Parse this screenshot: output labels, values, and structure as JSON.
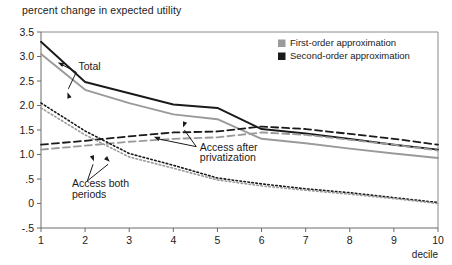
{
  "chart_data": {
    "type": "line",
    "title": "percent change in expected utility",
    "xlabel": "decile",
    "ylabel": "",
    "x": [
      1,
      2,
      3,
      4,
      5,
      6,
      7,
      8,
      9,
      10
    ],
    "xlim": [
      1,
      10
    ],
    "ylim": [
      -0.5,
      3.5
    ],
    "yticks": [
      "3.5",
      "3.0",
      "2.5",
      "2.0",
      "1.5",
      "1.0",
      ".5",
      "0",
      "-.5"
    ],
    "ytick_values": [
      3.5,
      3.0,
      2.5,
      2.0,
      1.5,
      1.0,
      0.5,
      0,
      -0.5
    ],
    "xticks": [
      "1",
      "2",
      "3",
      "4",
      "5",
      "6",
      "7",
      "8",
      "9",
      "10"
    ],
    "grid": false,
    "legend_position": "top-right",
    "legend": [
      {
        "label": "First-order approximation",
        "color": "#9a9a9a"
      },
      {
        "label": "Second-order approximation",
        "color": "#1a1a1a"
      }
    ],
    "series": [
      {
        "name": "Total (second-order)",
        "group": "Total",
        "order": "second",
        "color": "#1a1a1a",
        "style": "solid",
        "values": [
          3.3,
          2.48,
          2.25,
          2.02,
          1.95,
          1.52,
          1.43,
          1.32,
          1.2,
          1.1
        ]
      },
      {
        "name": "Total (first-order)",
        "group": "Total",
        "order": "first",
        "color": "#9a9a9a",
        "style": "solid",
        "values": [
          3.05,
          2.32,
          2.05,
          1.82,
          1.72,
          1.32,
          1.23,
          1.12,
          1.02,
          0.93
        ]
      },
      {
        "name": "Access after privatization (second-order)",
        "group": "Access after privatization",
        "order": "second",
        "color": "#1a1a1a",
        "style": "dashed",
        "values": [
          1.2,
          1.28,
          1.37,
          1.45,
          1.47,
          1.57,
          1.52,
          1.42,
          1.32,
          1.2
        ]
      },
      {
        "name": "Access after privatization (first-order)",
        "group": "Access after privatization",
        "order": "first",
        "color": "#9a9a9a",
        "style": "dashed",
        "values": [
          1.1,
          1.18,
          1.26,
          1.32,
          1.35,
          1.45,
          1.4,
          1.3,
          1.2,
          1.08
        ]
      },
      {
        "name": "Access both periods (second-order)",
        "group": "Access both periods",
        "order": "second",
        "color": "#1a1a1a",
        "style": "dotted",
        "values": [
          2.05,
          1.48,
          1.02,
          0.78,
          0.52,
          0.4,
          0.3,
          0.22,
          0.12,
          0.02
        ]
      },
      {
        "name": "Access both periods (first-order)",
        "group": "Access both periods",
        "order": "first",
        "color": "#9a9a9a",
        "style": "dotted",
        "values": [
          1.95,
          1.4,
          0.95,
          0.72,
          0.48,
          0.36,
          0.27,
          0.19,
          0.1,
          0.0
        ]
      }
    ],
    "annotations": [
      {
        "text": "Total",
        "x": 1.85,
        "y": 2.72
      },
      {
        "text": "Access after",
        "x": 4.6,
        "y": 1.08
      },
      {
        "text": "privatization",
        "x": 4.6,
        "y": 0.86
      },
      {
        "text": "Access both",
        "x": 1.7,
        "y": 0.33
      },
      {
        "text": "periods",
        "x": 1.7,
        "y": 0.12
      }
    ]
  }
}
